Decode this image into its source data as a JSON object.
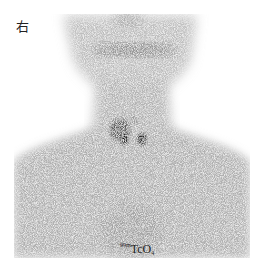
{
  "figure": {
    "type": "thyroid scintigraphy (anterior view)",
    "side_marker": "右",
    "tracer": {
      "mass_number": "99m",
      "symbol": "TcO",
      "subscript": "4"
    },
    "colors": {
      "background": "#ffffff",
      "body_uptake": "#b8b8b8",
      "salivary_band": "#8a8a8a",
      "thyroid_hotspot": "#1a1a1a",
      "text": "#222222"
    }
  }
}
